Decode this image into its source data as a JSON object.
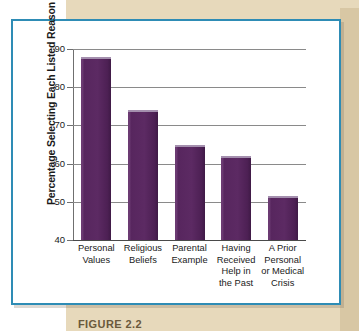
{
  "figure": {
    "caption": "FIGURE 2.2",
    "panel_border_color": "#2e8cb5",
    "page_background_color": "#e7d9bb",
    "bar_color": "#5c2a63"
  },
  "chart_data": {
    "type": "bar",
    "title": "",
    "xlabel": "",
    "ylabel": "Percentage Selecting Each Listed Reason",
    "categories": [
      "Personal Values",
      "Religious Beliefs",
      "Parental Example",
      "Having Received Help in the Past",
      "A Prior Personal or Medical Crisis"
    ],
    "category_lines": [
      [
        "Personal",
        "Values"
      ],
      [
        "Religious",
        "Beliefs"
      ],
      [
        "Parental",
        "Example"
      ],
      [
        "Having",
        "Received",
        "Help in",
        "the Past"
      ],
      [
        "A Prior",
        "Personal",
        "or Medical",
        "Crisis"
      ]
    ],
    "values": [
      88,
      74,
      65,
      62,
      51.5
    ],
    "ylim": [
      40,
      90
    ],
    "yticks": [
      40,
      50,
      60,
      70,
      80,
      90
    ],
    "ytick_labels": [
      "40",
      "50",
      "60",
      "70",
      "80",
      "90"
    ],
    "grid": true,
    "legend": "none"
  }
}
